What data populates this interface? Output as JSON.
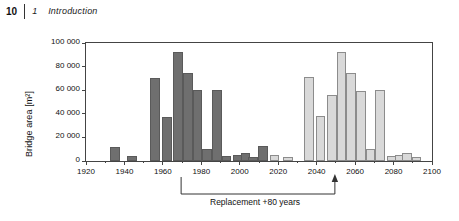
{
  "header": {
    "folio": "10",
    "chapter_number": "1",
    "chapter_title": "Introduction"
  },
  "annotation": {
    "label": "Replacement +80 years",
    "bracket_from_year": 1970,
    "bracket_to_year": 2050,
    "arrow": "up-arrow-icon"
  },
  "colors": {
    "historical_bar": "#6f6f6f",
    "historical_bar_outline": "#5a5a5a",
    "projected_bar": "#d9d9d9",
    "projected_bar_outline": "#8c8c8c",
    "axis": "#444444",
    "text": "#111111"
  },
  "chart_data": {
    "type": "bar",
    "title": "",
    "xlabel": "",
    "ylabel": "Bridge area [m²]",
    "xlim": [
      1920,
      2100
    ],
    "ylim": [
      0,
      100000
    ],
    "xticks": [
      1920,
      1940,
      1960,
      1980,
      2000,
      2020,
      2040,
      2060,
      2080,
      2100
    ],
    "xtick_labels": [
      "1920",
      "1940",
      "1960",
      "1980",
      "2000",
      "2020",
      "2040",
      "2060",
      "2080",
      "2100"
    ],
    "yticks": [
      0,
      20000,
      40000,
      60000,
      80000,
      100000
    ],
    "ytick_labels": [
      "0",
      "20 000",
      "40 000",
      "60 000",
      "80 000",
      "100 000"
    ],
    "grid": false,
    "legend": null,
    "bar_width_years": 5,
    "series": [
      {
        "name": "Existing bridge area (built)",
        "color": "#6f6f6f",
        "x": [
          1935,
          1944,
          1956,
          1962,
          1968,
          1973,
          1978,
          1983,
          1988,
          1993,
          1999,
          2003,
          2007,
          2012
        ],
        "values": [
          12000,
          4000,
          70000,
          37000,
          92000,
          75000,
          60000,
          10000,
          60000,
          4000,
          5000,
          7000,
          3000,
          13000
        ]
      },
      {
        "name": "Replacement demand (+80 years)",
        "color": "#d9d9d9",
        "x": [
          2018,
          2025,
          2036,
          2042,
          2048,
          2053,
          2058,
          2063,
          2068,
          2073,
          2079,
          2083,
          2087,
          2092
        ],
        "values": [
          5000,
          3000,
          71000,
          38000,
          56000,
          92000,
          75000,
          59000,
          10000,
          60000,
          4000,
          5000,
          7000,
          3000
        ]
      }
    ]
  }
}
